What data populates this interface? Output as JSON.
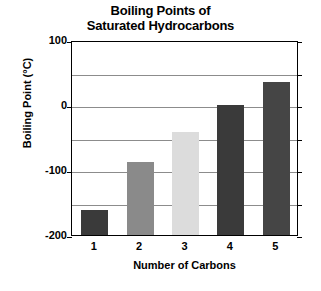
{
  "chart_data": {
    "type": "bar",
    "title": "Boiling Points of Saturated Hydrocarbons",
    "title_lines": [
      "Boiling Points of",
      "Saturated Hydrocarbons"
    ],
    "xlabel": "Number of Carbons",
    "ylabel": "Boiling Point (°C)",
    "categories": [
      "1",
      "2",
      "3",
      "4",
      "5"
    ],
    "values": [
      -162,
      -88,
      -42,
      0,
      36
    ],
    "ylim": [
      -200,
      100
    ],
    "ytick_labels": [
      "100",
      "0",
      "-100",
      "-200"
    ],
    "ytick_values": [
      100,
      0,
      -100,
      -200
    ],
    "gridline_values": [
      50,
      0,
      -50,
      -100,
      -150
    ],
    "grid": true,
    "legend": "none",
    "bar_colors": [
      "#3a3a3a",
      "#8a8a8a",
      "#dcdcdc",
      "#3a3a3a",
      "#454545"
    ]
  },
  "colors": {
    "axis": "#000000",
    "grid": "#8c8c8c",
    "background": "#ffffff",
    "text": "#000000"
  }
}
